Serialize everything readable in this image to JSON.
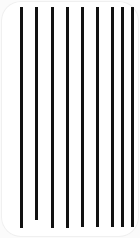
{
  "canvas": {
    "width": 140,
    "height": 238,
    "background_color": "#fbfbfb"
  },
  "card": {
    "name": "rounded-white-card",
    "fill_color": "#ffffff",
    "edge_color": "#f0f0f0",
    "corner_radius": 20,
    "x": 1,
    "y": 1,
    "width": 138,
    "height": 236
  },
  "figure": {
    "title": "",
    "stroke_color": "#111111",
    "stroke_width": 3,
    "line_count": 9,
    "spacing": 15.5,
    "top_y": 7
  },
  "chart_data": {
    "type": "bar",
    "title": "",
    "subtitle": "",
    "xlabel": "",
    "ylabel": "",
    "grid": false,
    "legend": null,
    "orientation": "vertical",
    "categories": [
      "1",
      "2",
      "3",
      "4",
      "5",
      "6",
      "7",
      "8",
      "9"
    ],
    "values": [
      221,
      213,
      221,
      221,
      220,
      220,
      220,
      220,
      220
    ],
    "ylim": [
      0,
      238
    ],
    "x": [
      21,
      36.5,
      52,
      67,
      82,
      97,
      112,
      122,
      132
    ],
    "lines": [
      {
        "id": "line-1",
        "x": 21,
        "y_top": 7,
        "y_bottom": 228,
        "width": 3,
        "color": "#111111"
      },
      {
        "id": "line-2",
        "x": 36.5,
        "y_top": 7,
        "y_bottom": 220,
        "width": 3,
        "color": "#111111"
      },
      {
        "id": "line-3",
        "x": 52,
        "y_top": 7,
        "y_bottom": 228,
        "width": 3,
        "color": "#111111"
      },
      {
        "id": "line-4",
        "x": 67,
        "y_top": 7,
        "y_bottom": 228,
        "width": 3,
        "color": "#111111"
      },
      {
        "id": "line-5",
        "x": 82,
        "y_top": 7,
        "y_bottom": 227,
        "width": 3,
        "color": "#111111"
      },
      {
        "id": "line-6",
        "x": 97,
        "y_top": 7,
        "y_bottom": 227,
        "width": 3,
        "color": "#111111"
      },
      {
        "id": "line-7",
        "x": 112,
        "y_top": 7,
        "y_bottom": 227,
        "width": 3,
        "color": "#111111"
      },
      {
        "id": "line-8",
        "x": 122,
        "y_top": 7,
        "y_bottom": 227,
        "width": 3,
        "color": "#111111"
      },
      {
        "id": "line-9",
        "x": 132,
        "y_top": 7,
        "y_bottom": 227,
        "width": 3,
        "color": "#111111"
      }
    ]
  }
}
